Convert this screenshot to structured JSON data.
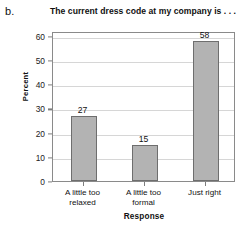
{
  "panel": {
    "letter": "b."
  },
  "chart_data": {
    "type": "bar",
    "title": "The current dress code at my company is . . .",
    "xlabel": "Response",
    "ylabel": "Percent",
    "categories": [
      "A little too relaxed",
      "A little too formal",
      "Just right"
    ],
    "category_lines": [
      [
        "A little too",
        "relaxed"
      ],
      [
        "A little too",
        "formal"
      ],
      [
        "Just right",
        ""
      ]
    ],
    "values": [
      27,
      15,
      58
    ],
    "value_labels": [
      "27",
      "15",
      "58"
    ],
    "ylim": [
      0,
      62
    ],
    "yticks": [
      0,
      10,
      20,
      30,
      40,
      50,
      60
    ],
    "ytick_labels": [
      "0",
      "10",
      "20",
      "30",
      "40",
      "50",
      "60"
    ],
    "grid": true,
    "legend": false,
    "bar_fill": "#b3b3b3",
    "bar_edge": "#6e6e6e",
    "grid_color": "#d6d6d6",
    "frame_color": "#8a8a8a"
  }
}
